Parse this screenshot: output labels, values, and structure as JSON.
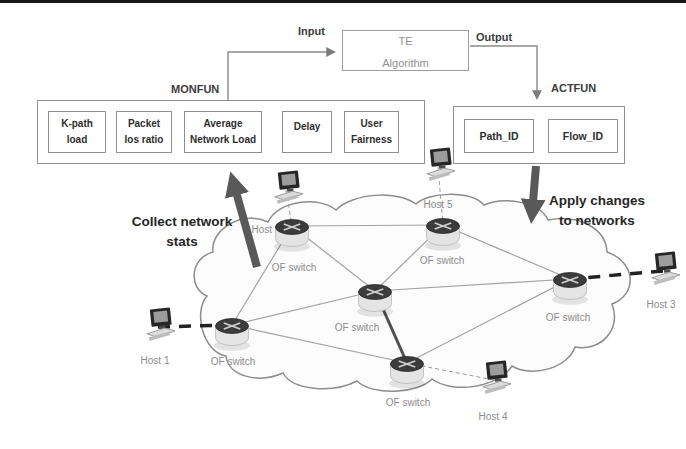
{
  "labels": {
    "input": "Input",
    "output": "Output",
    "collect_line1": "Collect network",
    "collect_line2": "stats",
    "apply_line1": "Apply changes",
    "apply_line2": "to networks"
  },
  "te": {
    "line1": "TE",
    "line2": "Algorithm"
  },
  "monfun": {
    "label": "MONFUN",
    "items": [
      {
        "line1": "K-path",
        "line2": "load"
      },
      {
        "line1": "Packet",
        "line2": "los ratio"
      },
      {
        "line1": "Average",
        "line2": "Network Load"
      },
      {
        "line1": "Delay",
        "line2": ""
      },
      {
        "line1": "User",
        "line2": "Fairness"
      }
    ]
  },
  "actfun": {
    "label": "ACTFUN",
    "items": [
      {
        "label": "Path_ID"
      },
      {
        "label": "Flow_ID"
      }
    ]
  },
  "network": {
    "switch_label": "OF switch",
    "switches": [
      {
        "id": "s1",
        "x": 292,
        "y": 226,
        "lx": 294,
        "ly": 271
      },
      {
        "id": "s2",
        "x": 443,
        "y": 225,
        "lx": 442,
        "ly": 264
      },
      {
        "id": "s3",
        "x": 375,
        "y": 291,
        "lx": 357,
        "ly": 331
      },
      {
        "id": "s4",
        "x": 232,
        "y": 325,
        "lx": 233,
        "ly": 365
      },
      {
        "id": "s5",
        "x": 570,
        "y": 279,
        "lx": 568,
        "ly": 321
      },
      {
        "id": "s6",
        "x": 407,
        "y": 363,
        "lx": 408,
        "ly": 406
      }
    ],
    "hosts": [
      {
        "id": "h1",
        "label": "Host 1",
        "x": 158,
        "y": 327,
        "lx": 155,
        "ly": 364,
        "link": "s4",
        "link_style": "thick"
      },
      {
        "id": "h2",
        "label": "Host 2",
        "x": 286,
        "y": 190,
        "lx": 266,
        "ly": 233,
        "link": "s1",
        "link_style": "thin"
      },
      {
        "id": "h3",
        "label": "Host 3",
        "x": 663,
        "y": 271,
        "lx": 661,
        "ly": 308,
        "link": "s5",
        "link_style": "thick"
      },
      {
        "id": "h4",
        "label": "Host 4",
        "x": 494,
        "y": 380,
        "lx": 493,
        "ly": 420,
        "link": "s6",
        "link_style": "thin"
      },
      {
        "id": "h5",
        "label": "Host 5",
        "x": 438,
        "y": 167,
        "lx": 438,
        "ly": 208,
        "link": "s2",
        "link_style": "thin"
      }
    ],
    "edges": [
      [
        "s1",
        "s2"
      ],
      [
        "s1",
        "s3"
      ],
      [
        "s1",
        "s4"
      ],
      [
        "s2",
        "s3"
      ],
      [
        "s2",
        "s5"
      ],
      [
        "s3",
        "s4"
      ],
      [
        "s3",
        "s5"
      ],
      [
        "s3",
        "s6",
        "thick"
      ],
      [
        "s4",
        "s6"
      ],
      [
        "s5",
        "s6"
      ]
    ]
  },
  "colors": {
    "thick_arrow": "#595959",
    "flow_line": "#8a8a8a",
    "edge": "#a3a3a3",
    "edge_thick": "#4f4f4f",
    "host_link_thick": "#222222",
    "host_link_thin": "#9b9b9b",
    "node_label": "#8c8c8c",
    "text_dark": "#2b2b2b"
  }
}
